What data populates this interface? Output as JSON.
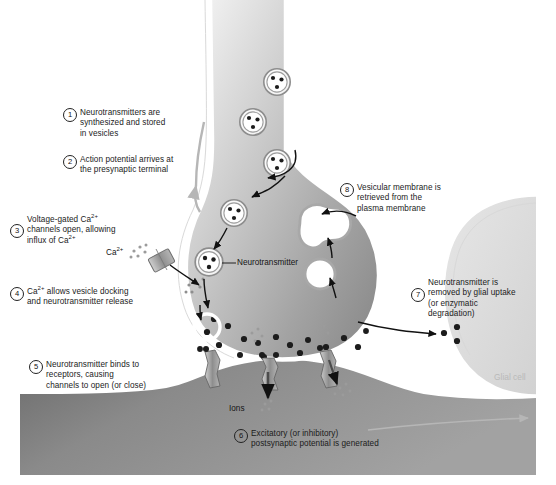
{
  "figure": {
    "background": "#ffffff"
  },
  "steps": [
    {
      "number": "1",
      "text": "Neurotransmitters are\nsynthesized and stored\nin vesicles"
    },
    {
      "number": "2",
      "text": "Action potential arrives at\nthe presynaptic terminal"
    },
    {
      "number": "3",
      "text": "Voltage-gated Ca2+\nchannels open, allowing\ninflux of Ca2+"
    },
    {
      "number": "4",
      "text": "Ca2+ allows vesicle docking\nand neurotransmitter release"
    },
    {
      "number": "5",
      "text": "Neurotransmitter binds to\nreceptors, causing\nchannels to open (or close)"
    },
    {
      "number": "6",
      "text": "Excitatory (or inhibitory)\npostsynaptic potential is generated"
    },
    {
      "number": "7",
      "text": "Neurotransmitter is\nremoved by glial uptake\n(or enzymatic\ndegradation)"
    },
    {
      "number": "8",
      "text": "Vesicular membrane is\nretrieved from the\nplasma membrane"
    }
  ],
  "annotations": {
    "calcium": "Ca",
    "calcium_charge": "2+",
    "neurotransmitter": "Neurotransmitter",
    "ions": "Ions",
    "glial_cell": "Glial cell"
  },
  "colors": {
    "presynaptic_fill_light": "#e9e9e9",
    "presynaptic_fill_dark": "#9a9a9a",
    "postsynaptic_fill": "#8f8f8f",
    "postsynaptic_fill_dark": "#6f6f6f",
    "glial_fill": "#e2e2e2",
    "membrane_outline": "#ffffff",
    "vesicle_ring": "#8d8d8d",
    "dot": "#1c1c1c",
    "arrow": "#111111",
    "text": "#1b1b1b",
    "glial_text": "#b9b9b9"
  }
}
